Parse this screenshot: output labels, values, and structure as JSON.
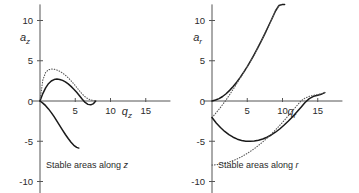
{
  "figure": {
    "background": "#ffffff",
    "solid_color": "#1a1a1a",
    "dotted_color": "#555555",
    "axis_color": "#555555"
  },
  "panels": [
    {
      "id": "axial",
      "caption_prefix": "Stable areas along ",
      "caption_symbol": "z",
      "ylabel_base": "a",
      "ylabel_sub": "z",
      "xlabel_base": "q",
      "xlabel_sub": "z",
      "xticks": [
        5,
        10,
        15
      ],
      "yticks": [
        10,
        5,
        0,
        -5,
        -10
      ],
      "xlim": [
        -1.2,
        18.5
      ],
      "ylim": [
        -11.5,
        12.0
      ]
    },
    {
      "id": "radial",
      "caption_prefix": "Stable areas along ",
      "caption_symbol": "r",
      "ylabel_base": "a",
      "ylabel_sub": "r",
      "xlabel_base": "q",
      "xlabel_sub": "r",
      "xticks": [
        5,
        10,
        15
      ],
      "yticks": [
        10,
        5,
        0,
        -5,
        -10
      ],
      "xlim": [
        -1.2,
        18.5
      ],
      "ylim": [
        -11.5,
        12.0
      ]
    }
  ],
  "chart_data": [
    {
      "type": "line",
      "id": "axial",
      "title": "Stable areas along z",
      "xlabel": "q_z",
      "ylabel": "a_z",
      "xlim": [
        -1.2,
        18.5
      ],
      "ylim": [
        -11.5,
        12.0
      ],
      "xticks": [
        5,
        10,
        15
      ],
      "yticks": [
        10,
        5,
        0,
        -5,
        -10
      ],
      "grid": false,
      "legend": "none",
      "series": [
        {
          "name": "beta_z = 0 boundary (exact, solid)",
          "style": "solid",
          "color": "#1a1a1a",
          "x": [
            0.0,
            0.4,
            0.8,
            1.2,
            1.6,
            2.0,
            2.4,
            2.8,
            3.2,
            3.6,
            4.0,
            4.4,
            4.8,
            5.2,
            5.6,
            6.0,
            6.4,
            6.8,
            7.2,
            7.6,
            7.9
          ],
          "y": [
            0.0,
            0.92,
            1.64,
            2.15,
            2.48,
            2.66,
            2.72,
            2.68,
            2.56,
            2.37,
            2.12,
            1.82,
            1.47,
            1.08,
            0.66,
            0.22,
            -0.18,
            -0.42,
            -0.48,
            -0.32,
            0.0
          ]
        },
        {
          "name": "beta_z = 0 boundary (approx, dotted)",
          "style": "dotted",
          "color": "#555555",
          "x": [
            0.0,
            0.4,
            0.8,
            1.2,
            1.6,
            2.0,
            2.4,
            2.8,
            3.2,
            3.6,
            4.0,
            4.4,
            4.8,
            5.2,
            5.6,
            6.0,
            6.4,
            6.8,
            7.2,
            7.6,
            7.9
          ],
          "y": [
            0.0,
            2.6,
            3.55,
            3.88,
            3.97,
            3.95,
            3.85,
            3.69,
            3.47,
            3.2,
            2.88,
            2.52,
            2.12,
            1.7,
            1.26,
            0.86,
            0.52,
            0.28,
            0.14,
            0.05,
            0.0
          ]
        },
        {
          "name": "beta_z = 1 boundary (solid, descending)",
          "style": "solid",
          "color": "#1a1a1a",
          "x": [
            0.0,
            0.4,
            0.8,
            1.2,
            1.6,
            2.0,
            2.4,
            2.8,
            3.2,
            3.6,
            4.0,
            4.4,
            4.8,
            5.2,
            5.5
          ],
          "y": [
            0.0,
            -0.26,
            -0.58,
            -0.98,
            -1.44,
            -1.95,
            -2.5,
            -3.06,
            -3.62,
            -4.16,
            -4.66,
            -5.12,
            -5.5,
            -5.76,
            -5.85
          ]
        }
      ],
      "annotations": [
        {
          "text": "Stable areas along z",
          "x": 3.5,
          "y": -10.2
        }
      ]
    },
    {
      "type": "line",
      "id": "radial",
      "title": "Stable areas along r",
      "xlabel": "q_r",
      "ylabel": "a_r",
      "xlim": [
        -1.2,
        18.5
      ],
      "ylim": [
        -11.5,
        12.0
      ],
      "xticks": [
        5,
        10,
        15
      ],
      "yticks": [
        10,
        5,
        0,
        -5,
        -10
      ],
      "grid": false,
      "legend": "none",
      "series": [
        {
          "name": "upper boundary (exact, solid)",
          "style": "solid",
          "color": "#1a1a1a",
          "x": [
            0.0,
            0.5,
            1.0,
            1.5,
            2.0,
            2.5,
            3.0,
            3.5,
            4.0,
            4.5,
            5.0,
            5.5,
            6.0,
            6.5,
            7.0,
            7.5,
            8.0,
            8.5,
            9.0,
            9.5,
            10.0,
            10.3
          ],
          "y": [
            0.0,
            0.12,
            0.3,
            0.56,
            0.9,
            1.32,
            1.8,
            2.34,
            2.94,
            3.58,
            4.28,
            5.02,
            5.8,
            6.62,
            7.48,
            8.36,
            9.28,
            10.22,
            11.18,
            11.86,
            12.0,
            12.0
          ]
        },
        {
          "name": "upper boundary (approx, dotted)",
          "style": "dotted",
          "color": "#555555",
          "x": [
            0.0,
            0.5,
            1.0,
            1.5,
            2.0,
            2.5,
            3.0,
            3.5,
            4.0,
            4.5,
            5.0,
            5.5,
            6.0,
            6.5,
            7.0,
            7.5,
            8.0,
            8.5,
            9.0,
            9.5,
            10.0
          ],
          "y": [
            -2.05,
            -1.55,
            -1.02,
            -0.46,
            0.14,
            0.78,
            1.46,
            2.14,
            2.84,
            3.54,
            4.26,
            5.0,
            5.78,
            6.6,
            7.46,
            8.34,
            9.26,
            10.2,
            11.16,
            11.85,
            12.0
          ]
        },
        {
          "name": "lower boundary (exact, solid)",
          "style": "solid",
          "color": "#1a1a1a",
          "x": [
            0.0,
            0.6,
            1.2,
            1.8,
            2.4,
            3.0,
            3.6,
            4.2,
            4.8,
            5.4,
            6.0,
            6.6,
            7.2,
            7.8,
            8.4,
            9.0,
            9.6,
            10.2,
            10.8,
            11.4,
            12.0,
            12.6,
            13.2,
            13.8,
            14.4,
            15.0,
            15.6,
            16.0
          ],
          "y": [
            -2.05,
            -2.74,
            -3.3,
            -3.78,
            -4.18,
            -4.5,
            -4.74,
            -4.9,
            -4.99,
            -5.01,
            -4.98,
            -4.88,
            -4.72,
            -4.5,
            -4.22,
            -3.88,
            -3.48,
            -3.02,
            -2.52,
            -1.98,
            -1.4,
            -0.8,
            -0.18,
            0.3,
            0.58,
            0.72,
            0.88,
            1.05
          ]
        },
        {
          "name": "lower boundary (approx, dotted)",
          "style": "dotted",
          "color": "#555555",
          "x": [
            0.0,
            0.6,
            1.2,
            1.8,
            2.4,
            3.0,
            3.6,
            4.2,
            4.8,
            5.4,
            6.0,
            6.6,
            7.2,
            7.8,
            8.4,
            9.0,
            9.6,
            10.2,
            10.8,
            11.4,
            12.0,
            12.6,
            13.2,
            13.8,
            14.4,
            15.0,
            15.6,
            16.0
          ],
          "y": [
            -7.95,
            -7.92,
            -7.85,
            -7.74,
            -7.59,
            -7.4,
            -7.18,
            -6.92,
            -6.62,
            -6.28,
            -5.92,
            -5.52,
            -5.08,
            -4.62,
            -4.12,
            -3.6,
            -3.04,
            -2.46,
            -1.86,
            -1.24,
            -0.62,
            0.0,
            0.36,
            0.58,
            0.7,
            0.8,
            0.92,
            1.05
          ]
        }
      ],
      "annotations": [
        {
          "text": "Stable areas along r",
          "x": 3.5,
          "y": -10.2
        }
      ]
    }
  ]
}
